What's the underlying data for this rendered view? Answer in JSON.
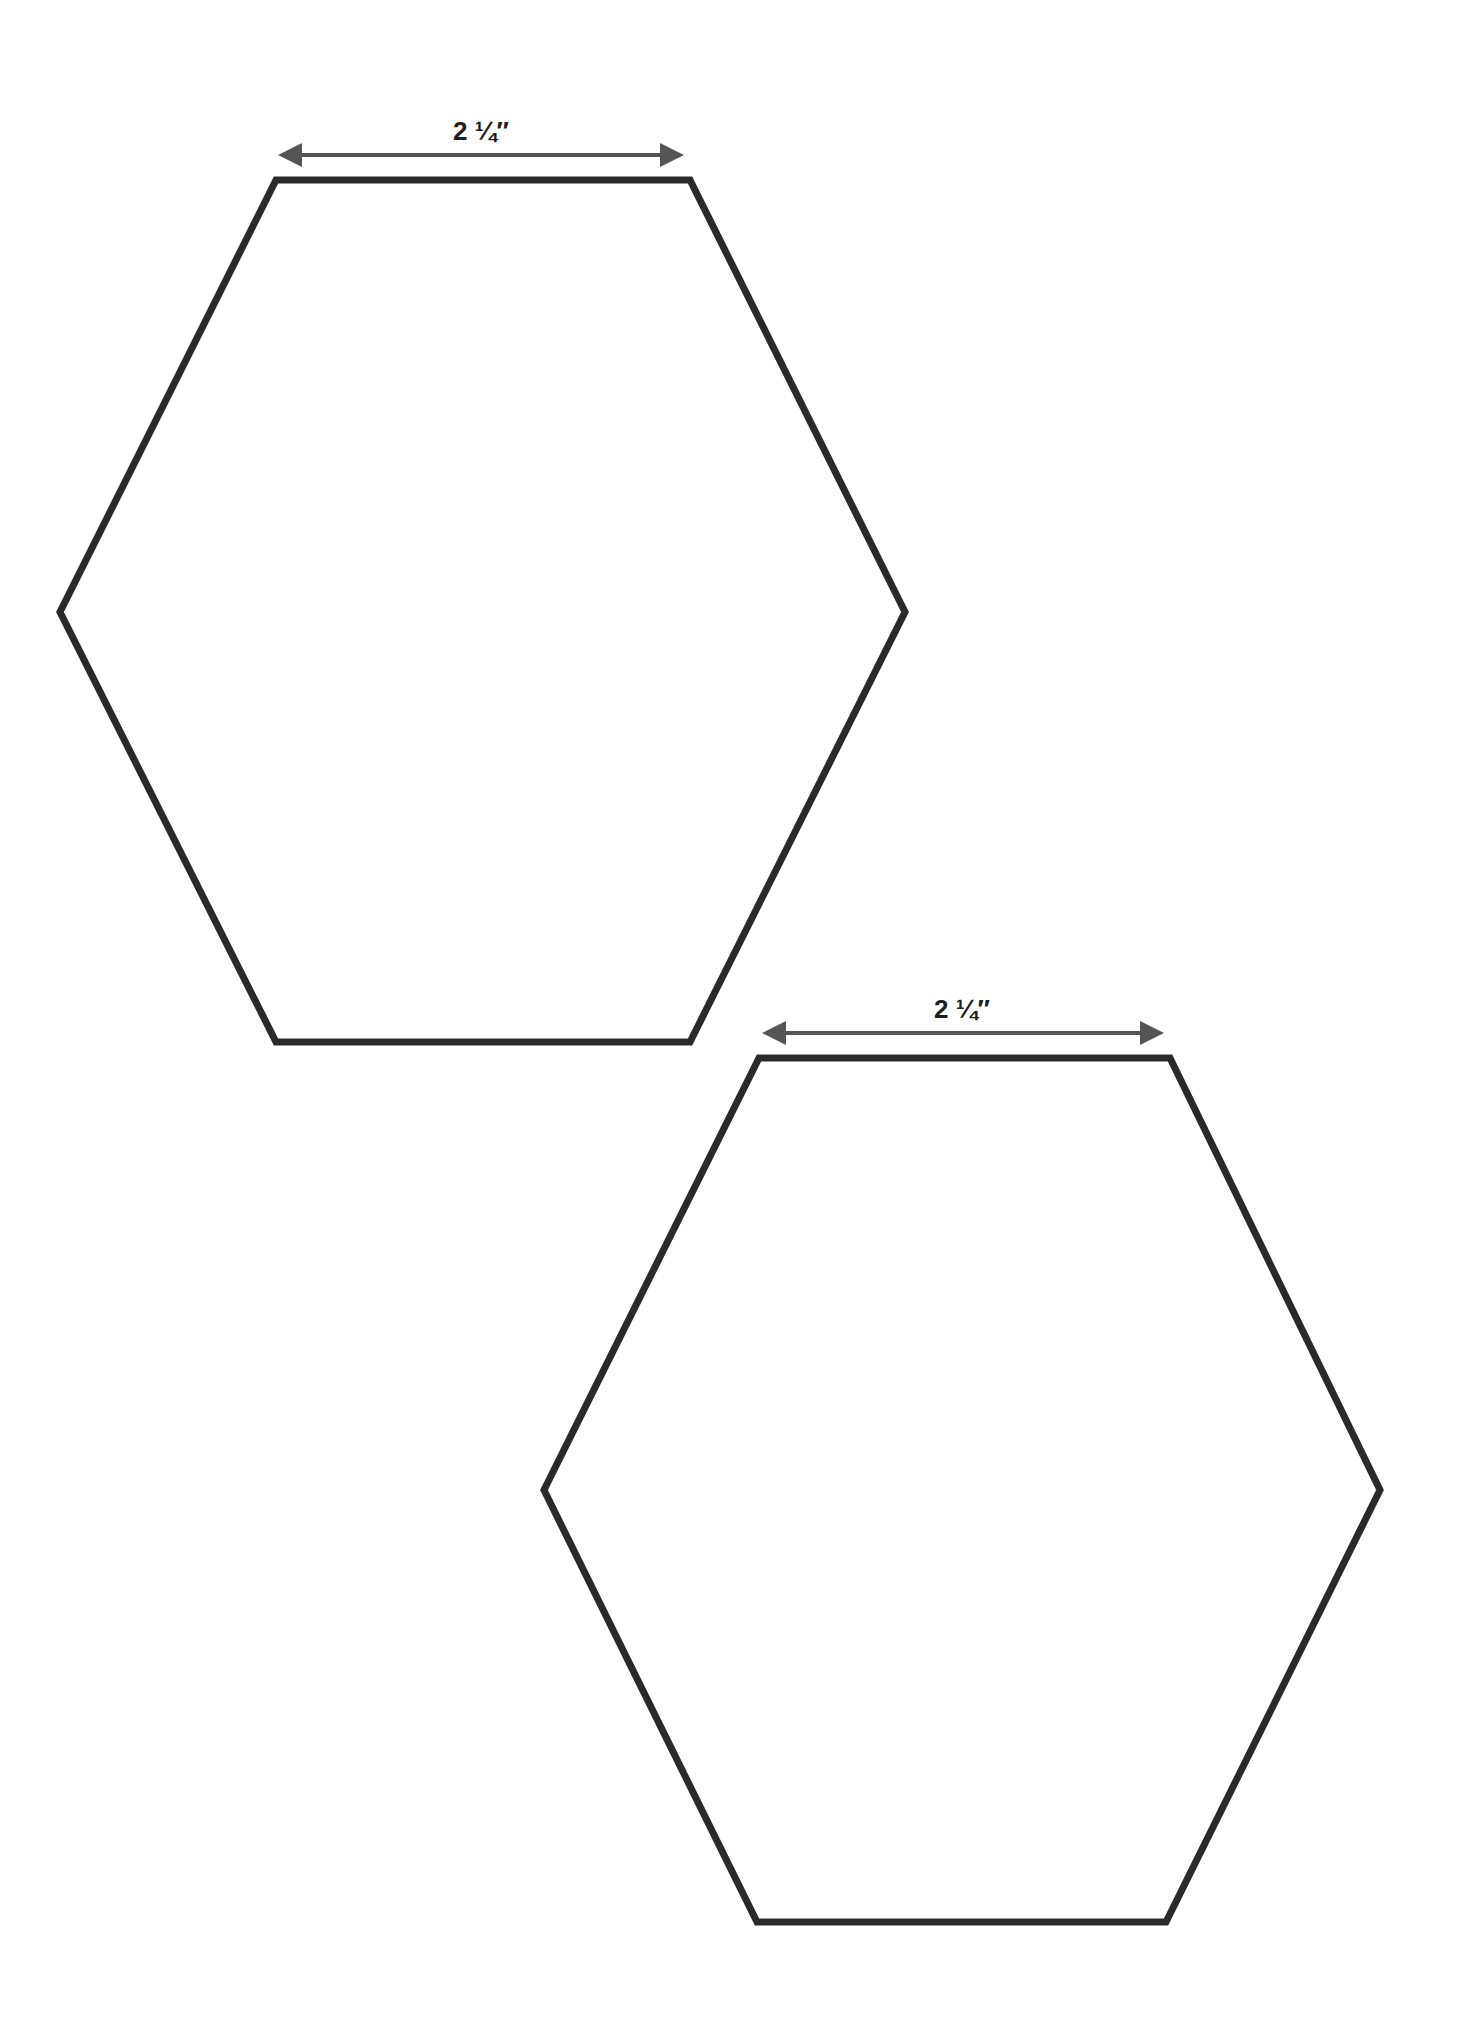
{
  "diagram": {
    "stroke_color": "#2a2a2a",
    "arrow_color": "#555555",
    "shapes": [
      {
        "id": "hexagon-1",
        "dimension_label": "2 ¼″",
        "side_length": "2 ¼ inch",
        "points": "276,180 690,180 905,612 690,1042 276,1042 60,612",
        "arrow": {
          "x1": 282,
          "x2": 680,
          "y": 155
        },
        "label_pos": {
          "x": 481,
          "y": 140
        }
      },
      {
        "id": "hexagon-2",
        "dimension_label": "2 ¼″",
        "side_length": "2 ¼ inch",
        "points": "759,1058 1170,1058 1380,1490 1166,1922 757,1922 544,1490",
        "arrow": {
          "x1": 766,
          "x2": 1160,
          "y": 1033
        },
        "label_pos": {
          "x": 962,
          "y": 1018
        }
      }
    ]
  }
}
